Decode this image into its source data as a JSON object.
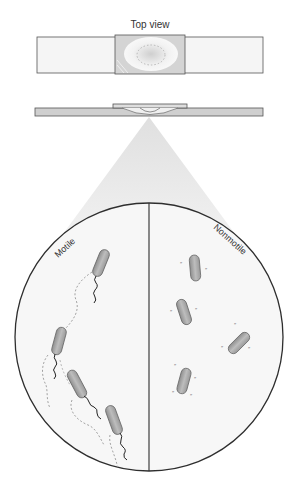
{
  "title": "Top view",
  "labels": {
    "motile": "Motile",
    "nonmotile": "Nonmotile"
  },
  "colors": {
    "outline": "#3a3a3a",
    "slide_fill": "#f4f4f4",
    "coverslip_fill": "#d9d9d9",
    "side_slide_fill": "#cfcfcf",
    "cone_fill": "#e6e6e6",
    "bacterium_fill": "#a9a9a9",
    "bacterium_stroke": "#6a6a6a",
    "trail": "#9a9a9a"
  },
  "panels": [
    {
      "name": "motile",
      "organism_count": 4
    },
    {
      "name": "nonmotile",
      "organism_count": 4
    }
  ]
}
